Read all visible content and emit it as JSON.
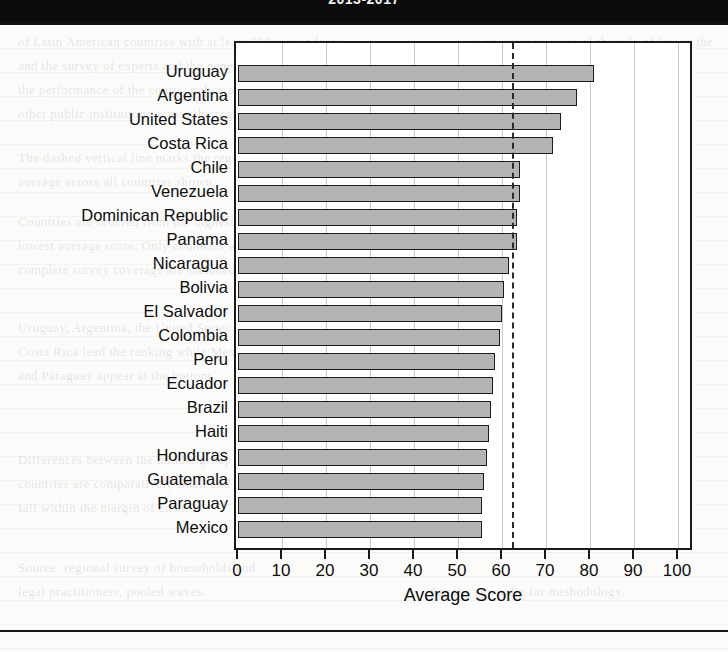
{
  "header": {
    "band_caption": "2013-2017"
  },
  "ghost_text": [
    {
      "text": "of Latin American countries with at least 100 respondents",
      "x": 18,
      "y": 34
    },
    {
      "text": "to an average score of the rule of law in the",
      "x": 470,
      "y": 34
    },
    {
      "text": "and the survey of experts and the general public on",
      "x": 18,
      "y": 58
    },
    {
      "text": "region. Scores are scaled from 0 to 100",
      "x": 470,
      "y": 58
    },
    {
      "text": "the performance of the courts, police and",
      "x": 18,
      "y": 82
    },
    {
      "text": "where higher values indicate",
      "x": 470,
      "y": 82
    },
    {
      "text": "other public institutions across the region.",
      "x": 18,
      "y": 106
    },
    {
      "text": "stronger adherence.",
      "x": 470,
      "y": 106
    },
    {
      "text": "The dashed vertical line marks the regional",
      "x": 18,
      "y": 150
    },
    {
      "text": "average across all countries shown.",
      "x": 18,
      "y": 174
    },
    {
      "text": "Countries are ordered from the highest to the",
      "x": 18,
      "y": 214
    },
    {
      "text": "lowest average score. Only countries with",
      "x": 18,
      "y": 238
    },
    {
      "text": "complete survey coverage are included.",
      "x": 18,
      "y": 262
    },
    {
      "text": "Uruguay, Argentina, the United States and",
      "x": 18,
      "y": 320
    },
    {
      "text": "Costa Rica lead the ranking while Mexico",
      "x": 18,
      "y": 344
    },
    {
      "text": "and Paraguay appear at the bottom.",
      "x": 18,
      "y": 368
    },
    {
      "text": "Differences between the middle group of",
      "x": 18,
      "y": 452
    },
    {
      "text": "countries are comparatively small and",
      "x": 18,
      "y": 476
    },
    {
      "text": "fall within the margin of error.",
      "x": 18,
      "y": 500
    },
    {
      "text": "Source: regional survey of households and",
      "x": 18,
      "y": 560
    },
    {
      "text": "legal practitioners, pooled waves.",
      "x": 18,
      "y": 584
    },
    {
      "text": "See the appendix for methodology.",
      "x": 430,
      "y": 584
    }
  ],
  "chart_data": {
    "type": "bar",
    "orientation": "horizontal",
    "title": "",
    "xlabel": "Average Score",
    "ylabel": "",
    "xlim": [
      0,
      100
    ],
    "xticks": [
      0,
      10,
      20,
      30,
      40,
      50,
      60,
      70,
      80,
      90,
      100
    ],
    "grid": true,
    "grid_axis": "x",
    "legend": false,
    "bar_color": "#b4b4b4",
    "bar_edge_color": "#1c1c1c",
    "reference_line": {
      "value": 62.2,
      "style": "dashed",
      "color": "#2a2a2a",
      "label": ""
    },
    "categories": [
      "Uruguay",
      "Argentina",
      "United States",
      "Costa Rica",
      "Chile",
      "Venezuela",
      "Dominican Republic",
      "Panama",
      "Nicaragua",
      "Bolivia",
      "El Salvador",
      "Colombia",
      "Peru",
      "Ecuador",
      "Brazil",
      "Haiti",
      "Honduras",
      "Guatemala",
      "Paraguay",
      "Mexico"
    ],
    "values": [
      81.0,
      77.0,
      73.5,
      71.5,
      64.0,
      64.0,
      63.5,
      63.5,
      61.5,
      60.5,
      60.0,
      59.5,
      58.5,
      58.0,
      57.5,
      57.0,
      56.5,
      56.0,
      55.5,
      55.5
    ]
  }
}
